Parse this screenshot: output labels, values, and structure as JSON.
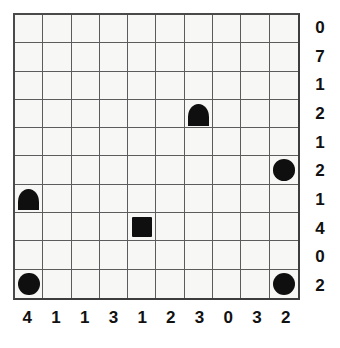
{
  "puzzle": {
    "type": "shape-placement-grid",
    "grid": {
      "rows": 10,
      "columns": 10,
      "background_color": "#f7f7f5",
      "line_color": "#5c5c5c",
      "border_color": "#3d3d3d"
    },
    "piece_color": "#100f0f",
    "row_clues": [
      {
        "index": 0,
        "label": "0"
      },
      {
        "index": 1,
        "label": "7"
      },
      {
        "index": 2,
        "label": "1"
      },
      {
        "index": 3,
        "label": "2"
      },
      {
        "index": 4,
        "label": "1"
      },
      {
        "index": 5,
        "label": "2"
      },
      {
        "index": 6,
        "label": "1"
      },
      {
        "index": 7,
        "label": "4"
      },
      {
        "index": 8,
        "label": "0"
      },
      {
        "index": 9,
        "label": "2"
      }
    ],
    "column_clues": [
      {
        "index": 0,
        "label": "4"
      },
      {
        "index": 1,
        "label": "1"
      },
      {
        "index": 2,
        "label": "1"
      },
      {
        "index": 3,
        "label": "3"
      },
      {
        "index": 4,
        "label": "1"
      },
      {
        "index": 5,
        "label": "2"
      },
      {
        "index": 6,
        "label": "3"
      },
      {
        "index": 7,
        "label": "0"
      },
      {
        "index": 8,
        "label": "3"
      },
      {
        "index": 9,
        "label": "2"
      }
    ],
    "pieces": [
      {
        "shape": "dome",
        "row": 3,
        "col": 6,
        "name": "dome-piece"
      },
      {
        "shape": "circle",
        "row": 5,
        "col": 9,
        "name": "circle-piece"
      },
      {
        "shape": "dome",
        "row": 6,
        "col": 0,
        "name": "dome-piece"
      },
      {
        "shape": "square",
        "row": 7,
        "col": 4,
        "name": "square-piece"
      },
      {
        "shape": "circle",
        "row": 9,
        "col": 0,
        "name": "circle-piece"
      },
      {
        "shape": "circle",
        "row": 9,
        "col": 9,
        "name": "circle-piece"
      }
    ]
  }
}
